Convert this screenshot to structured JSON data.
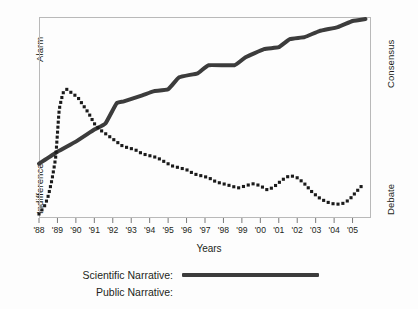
{
  "chart_data": {
    "type": "line",
    "title": "",
    "xlabel": "Years",
    "ylabel_left_top": "Alarm",
    "ylabel_left_bottom": "Indifference",
    "ylabel_right_top": "Consensus",
    "ylabel_right_bottom": "Debate",
    "grid": false,
    "legend_position": "bottom",
    "categories": [
      "'88",
      "'89",
      "'90",
      "'91",
      "'92",
      "'93",
      "'94",
      "'95",
      "'96",
      "'97",
      "'98",
      "'99",
      "'00",
      "'01",
      "'02",
      "'03",
      "'04",
      "'05"
    ],
    "x": [
      1988,
      1989,
      1990,
      1991,
      1992,
      1993,
      1994,
      1995,
      1996,
      1997,
      1998,
      1999,
      2000,
      2001,
      2002,
      2003,
      2004,
      2005
    ],
    "xlim": [
      1988,
      2006
    ],
    "ylim": [
      0,
      100
    ],
    "y_axis_note": "Unitless ordinal scale: left axis runs Indifference (low) to Alarm (high); right axis runs Debate (low) to Consensus (high)",
    "series": [
      {
        "name": "Scientific Narrative",
        "style": "solid",
        "color": "#3c3c3c",
        "x": [
          1988.0,
          1989.0,
          1990.0,
          1991.0,
          1991.6,
          1992.2,
          1992.6,
          1993.6,
          1994.2,
          1995.0,
          1995.6,
          1996.6,
          1997.2,
          1998.6,
          1999.2,
          2000.2,
          2001.0,
          2001.6,
          2002.4,
          2003.2,
          2004.2,
          2005.0,
          2005.7
        ],
        "values": [
          27,
          33,
          38,
          44,
          47,
          57,
          58,
          61,
          63,
          64,
          70,
          72,
          76,
          76,
          80,
          84,
          85,
          89,
          90,
          93,
          95,
          98,
          99
        ]
      },
      {
        "name": "Public Narrative",
        "style": "dotted",
        "color": "#1a1a1a",
        "x": [
          1988.0,
          1988.3,
          1988.5,
          1988.7,
          1988.9,
          1989.0,
          1989.1,
          1989.3,
          1989.5,
          1989.8,
          1990.1,
          1990.4,
          1990.7,
          1991.0,
          1991.3,
          1991.6,
          1991.9,
          1992.2,
          1992.5,
          1992.8,
          1993.2,
          1993.6,
          1994.0,
          1994.4,
          1994.8,
          1995.2,
          1995.6,
          1996.0,
          1996.4,
          1996.8,
          1997.2,
          1997.6,
          1998.0,
          1998.4,
          1998.8,
          1999.2,
          1999.6,
          2000.0,
          2000.4,
          2000.8,
          2001.2,
          2001.6,
          2002.0,
          2002.4,
          2002.8,
          2003.2,
          2003.6,
          2004.0,
          2004.4,
          2004.8,
          2005.2,
          2005.6
        ],
        "values": [
          2,
          6,
          11,
          19,
          30,
          42,
          54,
          62,
          64,
          62,
          60,
          56,
          52,
          47,
          44,
          42,
          40,
          38,
          36,
          35,
          34,
          32,
          31,
          30,
          28,
          26,
          25,
          24,
          22,
          21,
          20,
          18,
          17,
          16,
          15,
          16,
          17,
          16,
          14,
          16,
          19,
          21,
          20,
          17,
          13,
          10,
          8,
          7,
          7,
          9,
          13,
          17
        ]
      }
    ]
  },
  "legend": {
    "rows": [
      {
        "label": "Scientific Narrative:",
        "style": "solid"
      },
      {
        "label": "Public Narrative:",
        "style": "dotted"
      }
    ]
  }
}
